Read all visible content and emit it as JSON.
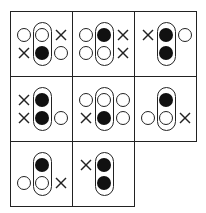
{
  "diagram": {
    "legend_symbols": {
      "open": "open-circle",
      "filled": "filled-circle",
      "cross": "cross-mark",
      "empty": "none"
    },
    "cells": [
      {
        "row": 0,
        "col": 0,
        "left": [
          "open",
          "cross"
        ],
        "capsule": [
          "open",
          "filled"
        ],
        "right": [
          "cross",
          "open"
        ]
      },
      {
        "row": 0,
        "col": 1,
        "left": [
          "open",
          "open"
        ],
        "capsule": [
          "filled",
          "open"
        ],
        "right": [
          "cross",
          "cross"
        ]
      },
      {
        "row": 0,
        "col": 2,
        "left": [
          "cross",
          "empty"
        ],
        "capsule": [
          "filled",
          "filled"
        ],
        "right": [
          "open",
          "empty"
        ]
      },
      {
        "row": 1,
        "col": 0,
        "left": [
          "cross",
          "cross"
        ],
        "capsule": [
          "filled",
          "filled"
        ],
        "right": [
          "empty",
          "open"
        ]
      },
      {
        "row": 1,
        "col": 1,
        "left": [
          "open",
          "cross"
        ],
        "capsule": [
          "open",
          "filled"
        ],
        "right": [
          "open",
          "open"
        ]
      },
      {
        "row": 1,
        "col": 2,
        "left": [
          "empty",
          "open"
        ],
        "capsule": [
          "filled",
          "open"
        ],
        "right": [
          "empty",
          "cross"
        ]
      },
      {
        "row": 2,
        "col": 0,
        "left": [
          "empty",
          "open"
        ],
        "capsule": [
          "filled",
          "open"
        ],
        "right": [
          "empty",
          "cross"
        ]
      },
      {
        "row": 2,
        "col": 1,
        "left": [
          "cross",
          "empty"
        ],
        "capsule": [
          "filled",
          "filled"
        ],
        "right": [
          "empty",
          "empty"
        ]
      }
    ],
    "colors": {
      "line": "#222222",
      "fill": "#111111",
      "background": "#ffffff"
    }
  }
}
